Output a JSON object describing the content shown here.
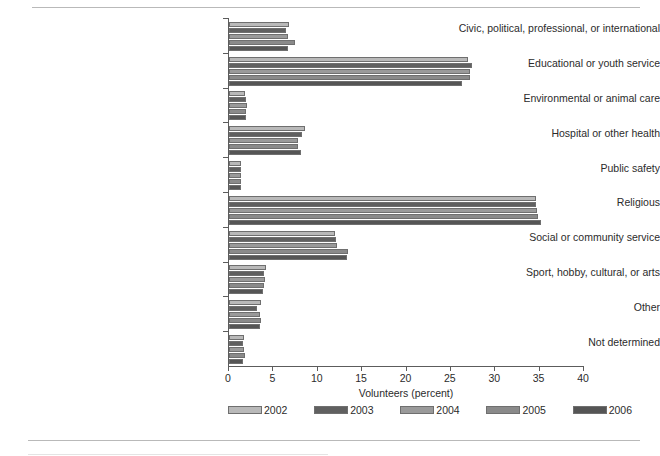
{
  "chart_data": {
    "type": "bar",
    "orientation": "horizontal",
    "title": "",
    "xlabel": "Volunteers (percent)",
    "ylabel": "",
    "xlim": [
      0,
      40
    ],
    "xticks": [
      0,
      5,
      10,
      15,
      20,
      25,
      30,
      35,
      40
    ],
    "grid": false,
    "legend_position": "bottom",
    "categories": [
      "Civic, political, professional, or international",
      "Educational or youth service",
      "Environmental or animal care",
      "Hospital or other health",
      "Public safety",
      "Religious",
      "Social or community service",
      "Sport, hobby, cultural, or arts",
      "Other",
      "Not determined"
    ],
    "series": [
      {
        "name": "2002",
        "color": "#b9b9b9",
        "values": [
          6.8,
          26.9,
          1.8,
          8.6,
          1.3,
          34.6,
          11.9,
          4.2,
          3.6,
          1.7
        ]
      },
      {
        "name": "2003",
        "color": "#606060",
        "values": [
          6.4,
          27.4,
          1.9,
          8.2,
          1.4,
          34.6,
          12.1,
          3.9,
          3.2,
          1.6
        ]
      },
      {
        "name": "2004",
        "color": "#9a9a9a",
        "values": [
          6.6,
          27.2,
          2.0,
          7.8,
          1.4,
          34.7,
          12.2,
          4.0,
          3.5,
          1.7
        ]
      },
      {
        "name": "2005",
        "color": "#8a8a8a",
        "values": [
          7.4,
          27.2,
          1.9,
          7.8,
          1.4,
          34.8,
          13.4,
          3.9,
          3.6,
          1.8
        ]
      },
      {
        "name": "2006",
        "color": "#555555",
        "values": [
          6.6,
          26.3,
          1.9,
          8.1,
          1.4,
          35.2,
          13.3,
          3.8,
          3.5,
          1.6
        ]
      }
    ]
  }
}
